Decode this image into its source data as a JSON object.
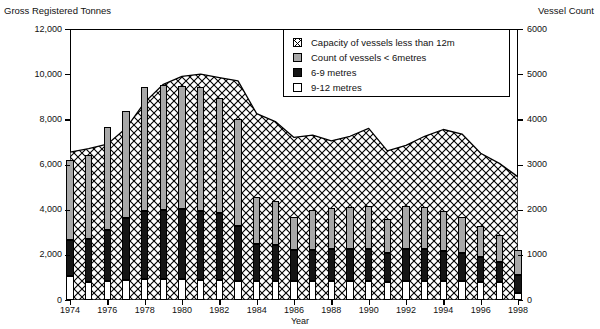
{
  "chart_data": {
    "type": "bar",
    "title": "",
    "xlabel": "Year",
    "ylabel": "Gross Registered Tonnes",
    "y2label": "Vessel Count",
    "grid": false,
    "legend_position": "top-right",
    "x": [
      1974,
      1975,
      1976,
      1977,
      1978,
      1979,
      1980,
      1981,
      1982,
      1983,
      1984,
      1985,
      1986,
      1987,
      1988,
      1989,
      1990,
      1991,
      1992,
      1993,
      1994,
      1995,
      1996,
      1997,
      1998
    ],
    "xtick_labels": [
      "1974",
      "1976",
      "1978",
      "1980",
      "1982",
      "1984",
      "1986",
      "1988",
      "1990",
      "1992",
      "1994",
      "1996",
      "1998"
    ],
    "xticks": [
      1974,
      1976,
      1978,
      1980,
      1982,
      1984,
      1986,
      1988,
      1990,
      1992,
      1994,
      1996,
      1998
    ],
    "ylim": [
      0,
      12000
    ],
    "yticks": [
      0,
      2000,
      4000,
      6000,
      8000,
      10000,
      12000
    ],
    "ytick_labels": [
      "0",
      "2,000",
      "4,000",
      "6,000",
      "8,000",
      "10,000",
      "12,000"
    ],
    "y2lim": [
      0,
      6000
    ],
    "y2ticks": [
      0,
      1000,
      2000,
      3000,
      4000,
      5000,
      6000
    ],
    "y2tick_labels": [
      "0",
      "1000",
      "2000",
      "3000",
      "4000",
      "5000",
      "6000"
    ],
    "series": [
      {
        "name": "Capacity of vessels less than 12m",
        "type": "area",
        "axis": "left",
        "unit": "Gross Registered Tonnes",
        "values": [
          6550,
          6700,
          6900,
          7600,
          8750,
          9550,
          9900,
          10000,
          9850,
          9700,
          8250,
          7900,
          7200,
          7300,
          7050,
          7250,
          7600,
          6600,
          6850,
          7250,
          7550,
          7350,
          6500,
          6050,
          5450
        ]
      },
      {
        "name": "Count of vessels < 6metres",
        "type": "bar-segment",
        "axis": "right",
        "unit": "Vessel Count",
        "values": [
          1780,
          1870,
          2290,
          2360,
          2760,
          2770,
          2720,
          2730,
          2540,
          2360,
          1030,
          980,
          730,
          880,
          900,
          940,
          970,
          740,
          960,
          950,
          900,
          790,
          670,
          580,
          560
        ]
      },
      {
        "name": "6-9 metres",
        "type": "bar-segment",
        "axis": "right",
        "unit": "Vessel Count",
        "values": [
          800,
          950,
          1120,
          1380,
          1500,
          1540,
          1560,
          1530,
          1490,
          1220,
          830,
          800,
          690,
          700,
          720,
          710,
          700,
          650,
          700,
          700,
          670,
          640,
          560,
          460,
          400
        ]
      },
      {
        "name": "9-12 metres",
        "type": "bar-segment",
        "axis": "right",
        "unit": "Vessel Count",
        "values": [
          530,
          400,
          420,
          440,
          460,
          460,
          460,
          450,
          440,
          420,
          420,
          420,
          410,
          410,
          420,
          410,
          420,
          400,
          420,
          420,
          410,
          410,
          400,
          390,
          150
        ]
      }
    ],
    "stacked_totals_vessel_count": [
      3110,
      3220,
      3830,
      4180,
      4720,
      4770,
      4740,
      4710,
      4470,
      4000,
      2280,
      2200,
      1830,
      1990,
      2040,
      2060,
      2090,
      1790,
      2080,
      2070,
      1980,
      1840,
      1630,
      1430,
      1110
    ]
  },
  "legend": {
    "items": [
      {
        "label": "Capacity of vessels less than 12m",
        "swatch": "crosshatch",
        "color": "#ffffff"
      },
      {
        "label": "Count of vessels < 6metres",
        "swatch": "solid",
        "color": "#a8a8a8"
      },
      {
        "label": "6-9 metres",
        "swatch": "solid",
        "color": "#151515"
      },
      {
        "label": "9-12 metres",
        "swatch": "solid",
        "color": "#ffffff"
      }
    ]
  },
  "axis_titles": {
    "left": "Gross Registered Tonnes",
    "right": "Vessel Count",
    "x": "Year"
  }
}
